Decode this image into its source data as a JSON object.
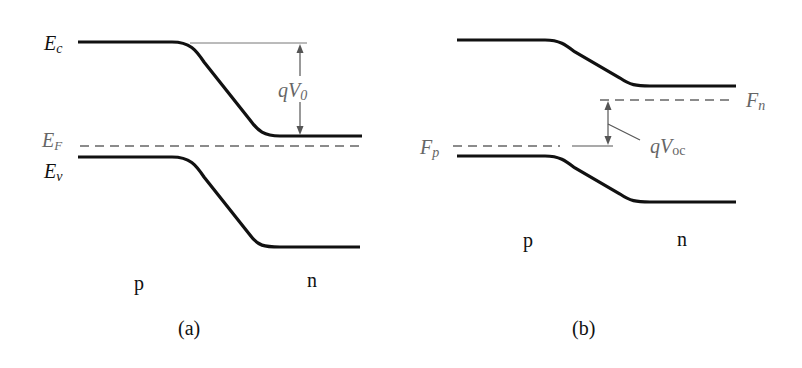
{
  "panels": [
    {
      "id": "a",
      "caption": "(a)",
      "title": "Equilibrium p-n junction band diagram",
      "labels": {
        "Ec": {
          "main": "E",
          "sub": "c"
        },
        "EF": {
          "main": "E",
          "sub": "F"
        },
        "Ev": {
          "main": "E",
          "sub": "v"
        },
        "barrier": {
          "main": "qV",
          "sub": "0"
        },
        "p_side": "p",
        "n_side": "n"
      }
    },
    {
      "id": "b",
      "caption": "(b)",
      "title": "Illuminated p-n junction (open circuit)",
      "labels": {
        "Fn": {
          "main": "F",
          "sub": "n"
        },
        "Fp": {
          "main": "F",
          "sub": "p"
        },
        "voltage": {
          "main": "qV",
          "sub": "oc"
        },
        "p_side": "p",
        "n_side": "n"
      }
    }
  ],
  "colors": {
    "band": "#111111",
    "reference": "#777777",
    "fermi": "#666666",
    "label_dark": "#111111",
    "label_grey": "#666666"
  }
}
